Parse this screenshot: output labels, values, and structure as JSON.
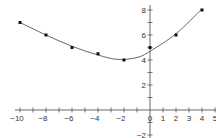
{
  "chart_data": {
    "type": "scatter",
    "title": "",
    "xlabel": "",
    "ylabel": "",
    "xlim": [
      -10,
      5
    ],
    "ylim": [
      -2,
      8
    ],
    "grid": false,
    "x_ticks": [
      -10,
      -8,
      -6,
      -4,
      -2,
      0,
      1,
      2,
      3,
      4,
      5
    ],
    "x_tick_labels": [
      "−10",
      "−8",
      "−6",
      "−4",
      "−2",
      "0",
      "1",
      "2",
      "3",
      "4",
      "5"
    ],
    "y_ticks": [
      -2,
      2,
      4,
      6,
      8
    ],
    "y_tick_labels": [
      "−2",
      "2",
      "4",
      "6",
      "8"
    ],
    "series": [
      {
        "name": "data points",
        "x": [
          -10,
          -8,
          -6,
          -4,
          -2,
          0,
          2,
          4
        ],
        "y": [
          7,
          6,
          5,
          4.5,
          4,
          5,
          6,
          8
        ]
      },
      {
        "name": "fitted curve",
        "type": "line",
        "x": [
          -10,
          -8,
          -6,
          -4,
          -2.5,
          -1,
          0,
          2,
          4
        ],
        "y": [
          7,
          6,
          5.1,
          4.4,
          4.05,
          4.2,
          4.7,
          6.1,
          8.1
        ]
      }
    ]
  }
}
